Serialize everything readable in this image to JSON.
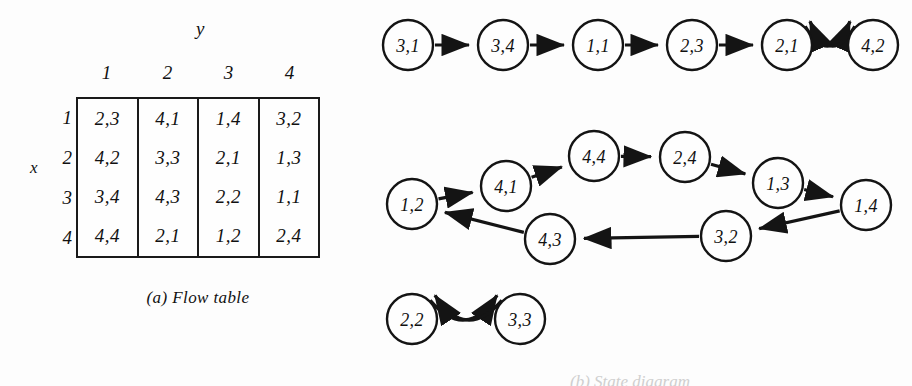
{
  "figure": {
    "background_color": "#fdfdfd",
    "ink_color": "#141414"
  },
  "flow_table": {
    "y_axis_label": "y",
    "x_axis_label": "x",
    "column_headers": [
      "1",
      "2",
      "3",
      "4"
    ],
    "row_headers": [
      "1",
      "2",
      "3",
      "4"
    ],
    "rows": [
      [
        "2,3",
        "4,1",
        "1,4",
        "3,2"
      ],
      [
        "4,2",
        "3,3",
        "2,1",
        "1,3"
      ],
      [
        "3,4",
        "4,3",
        "2,2",
        "1,1"
      ],
      [
        "4,4",
        "2,1",
        "1,2",
        "2,4"
      ]
    ],
    "caption": "(a) Flow table"
  },
  "state_graph": {
    "caption": "(b) State diagram",
    "components": [
      {
        "name": "top-chain",
        "nodes": [
          {
            "id": "n31",
            "label": "3,1",
            "cx": 48,
            "cy": 45,
            "r": 25
          },
          {
            "id": "n34",
            "label": "3,4",
            "cx": 143,
            "cy": 45,
            "r": 25
          },
          {
            "id": "n11",
            "label": "1,1",
            "cx": 238,
            "cy": 45,
            "r": 25
          },
          {
            "id": "n23",
            "label": "2,3",
            "cx": 332,
            "cy": 45,
            "r": 25
          },
          {
            "id": "n21",
            "label": "2,1",
            "cx": 427,
            "cy": 45,
            "r": 25
          },
          {
            "id": "n42",
            "label": "4,2",
            "cx": 513,
            "cy": 45,
            "r": 25
          }
        ],
        "edges": [
          {
            "from": "n31",
            "to": "n34",
            "style": "straight"
          },
          {
            "from": "n34",
            "to": "n11",
            "style": "straight"
          },
          {
            "from": "n11",
            "to": "n23",
            "style": "straight"
          },
          {
            "from": "n23",
            "to": "n21",
            "style": "straight"
          },
          {
            "from": "n21",
            "to": "n42",
            "style": "curve-up"
          },
          {
            "from": "n42",
            "to": "n21",
            "style": "curve-down"
          }
        ]
      },
      {
        "name": "middle-cycle",
        "nodes": [
          {
            "id": "m12",
            "label": "1,2",
            "cx": 52,
            "cy": 204,
            "r": 25
          },
          {
            "id": "m41",
            "label": "4,1",
            "cx": 146,
            "cy": 186,
            "r": 25
          },
          {
            "id": "m44",
            "label": "4,4",
            "cx": 234,
            "cy": 156,
            "r": 25
          },
          {
            "id": "m24",
            "label": "2,4",
            "cx": 325,
            "cy": 157,
            "r": 25
          },
          {
            "id": "m13",
            "label": "1,3",
            "cx": 418,
            "cy": 183,
            "r": 25
          },
          {
            "id": "m14",
            "label": "1,4",
            "cx": 506,
            "cy": 205,
            "r": 25
          },
          {
            "id": "m32",
            "label": "3,2",
            "cx": 366,
            "cy": 236,
            "r": 25
          },
          {
            "id": "m43",
            "label": "4,3",
            "cx": 190,
            "cy": 239,
            "r": 25
          }
        ],
        "edges": [
          {
            "from": "m12",
            "to": "m41",
            "style": "straight"
          },
          {
            "from": "m41",
            "to": "m44",
            "style": "straight"
          },
          {
            "from": "m44",
            "to": "m24",
            "style": "straight"
          },
          {
            "from": "m24",
            "to": "m13",
            "style": "straight"
          },
          {
            "from": "m13",
            "to": "m14",
            "style": "straight"
          },
          {
            "from": "m14",
            "to": "m32",
            "style": "straight"
          },
          {
            "from": "m32",
            "to": "m43",
            "style": "straight"
          },
          {
            "from": "m43",
            "to": "m12",
            "style": "straight"
          }
        ]
      },
      {
        "name": "bottom-pair",
        "nodes": [
          {
            "id": "b22",
            "label": "2,2",
            "cx": 52,
            "cy": 319,
            "r": 25
          },
          {
            "id": "b33",
            "label": "3,3",
            "cx": 160,
            "cy": 319,
            "r": 25
          }
        ],
        "edges": [
          {
            "from": "b22",
            "to": "b33",
            "style": "curve-up"
          },
          {
            "from": "b33",
            "to": "b22",
            "style": "curve-down"
          }
        ]
      }
    ]
  }
}
